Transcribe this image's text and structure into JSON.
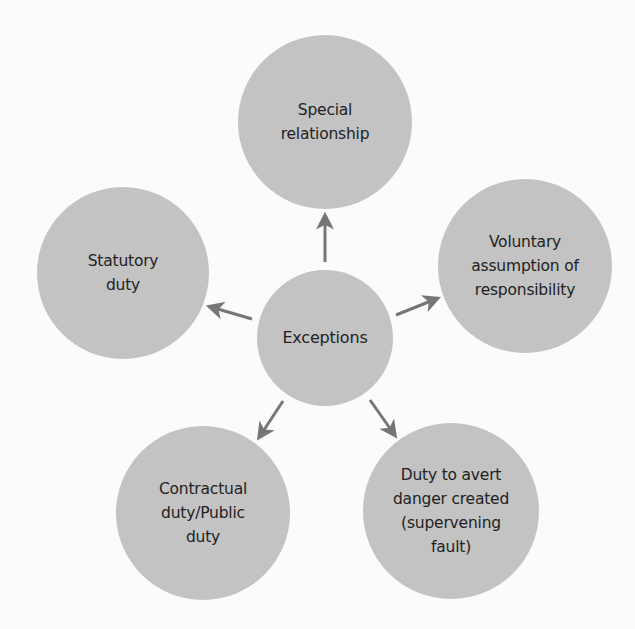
{
  "diagram": {
    "type": "hub-and-spoke",
    "colors": {
      "background": "#fbfbfb",
      "node_fill": "#c3c3c3",
      "text": "#222222",
      "arrow": "#767676"
    },
    "center": {
      "label": "Exceptions",
      "cx": 325,
      "cy": 338,
      "r": 68
    },
    "nodes": [
      {
        "id": "special-relationship",
        "label": "Special\nrelationship",
        "cx": 325,
        "cy": 122,
        "r": 87
      },
      {
        "id": "voluntary-assumption",
        "label": "Voluntary\nassumption of\nresponsibility",
        "cx": 525,
        "cy": 266,
        "r": 87
      },
      {
        "id": "duty-to-avert-danger",
        "label": "Duty to avert\ndanger created\n(supervening\nfault)",
        "cx": 451,
        "cy": 511,
        "r": 88
      },
      {
        "id": "contractual-public-duty",
        "label": "Contractual\nduty/Public\nduty",
        "cx": 203,
        "cy": 513,
        "r": 87
      },
      {
        "id": "statutory-duty",
        "label": "Statutory\nduty",
        "cx": 123,
        "cy": 273,
        "r": 86
      }
    ],
    "arrows": [
      {
        "to": "special-relationship",
        "x1": 325,
        "y1": 262,
        "x2": 325,
        "y2": 217
      },
      {
        "to": "voluntary-assumption",
        "x1": 396,
        "y1": 315,
        "x2": 436,
        "y2": 299
      },
      {
        "to": "duty-to-avert-danger",
        "x1": 370,
        "y1": 400,
        "x2": 394,
        "y2": 434
      },
      {
        "to": "contractual-public-duty",
        "x1": 283,
        "y1": 401,
        "x2": 260,
        "y2": 436
      },
      {
        "to": "statutory-duty",
        "x1": 252,
        "y1": 319,
        "x2": 211,
        "y2": 307
      }
    ]
  }
}
